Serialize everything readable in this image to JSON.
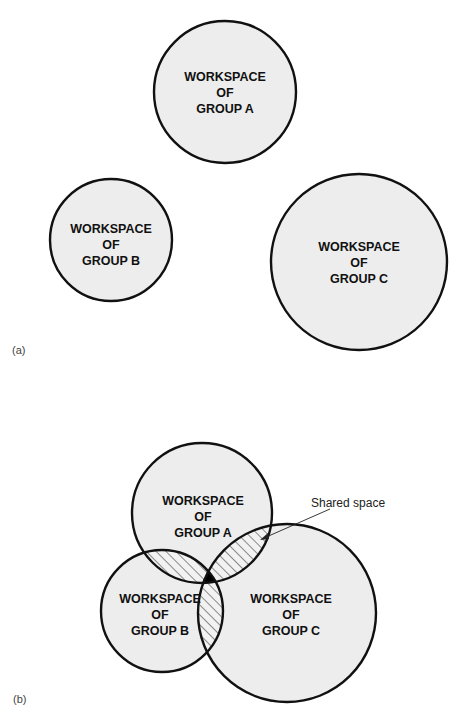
{
  "panels": {
    "a": {
      "label": "(a)",
      "groups": [
        {
          "id": "A",
          "line1": "WORKSPACE",
          "line2": "OF",
          "line3": "GROUP A",
          "cx": 225,
          "cy": 92,
          "r": 71
        },
        {
          "id": "B",
          "line1": "WORKSPACE",
          "line2": "OF",
          "line3": "GROUP B",
          "cx": 111,
          "cy": 240,
          "r": 61
        },
        {
          "id": "C",
          "line1": "WORKSPACE",
          "line2": "OF",
          "line3": "GROUP C",
          "cx": 359,
          "cy": 262,
          "r": 88
        }
      ]
    },
    "b": {
      "label": "(b)",
      "groups": [
        {
          "id": "A",
          "line1": "WORKSPACE",
          "line2": "OF",
          "line3": "GROUP A",
          "cx": 202,
          "cy": 513,
          "r": 70
        },
        {
          "id": "B",
          "line1": "WORKSPACE",
          "line2": "OF",
          "line3": "GROUP B",
          "cx": 162,
          "cy": 611,
          "r": 61
        },
        {
          "id": "C",
          "line1": "WORKSPACE",
          "line2": "OF",
          "line3": "GROUP C",
          "cx": 287,
          "cy": 613,
          "r": 89
        }
      ],
      "callout": {
        "text": "Shared space"
      }
    }
  },
  "colors": {
    "circle_fill": "#ededed",
    "stroke": "#111111",
    "background": "#ffffff"
  }
}
